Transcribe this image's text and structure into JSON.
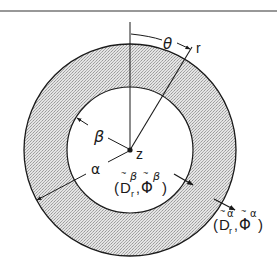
{
  "diagram": {
    "type": "annular cross-section (concentric cylinders) with polar coordinates",
    "colors": {
      "line": "#1a1a1a",
      "shell_fill": "#cfcfcf",
      "inner_fill": "#ffffff",
      "background": "#ffffff"
    },
    "geometry": {
      "center": [
        130,
        150
      ],
      "outer_radius": 106,
      "inner_radius": 63,
      "top_rule_y": 11
    },
    "labels": {
      "theta": "θ",
      "r": "r",
      "z": "z",
      "beta": "β",
      "alpha": "α",
      "inner_pair_open": "(",
      "inner_D": "D",
      "inner_D_sub": "r",
      "inner_D_sup": "β",
      "inner_comma": ",",
      "inner_Phi": "Φ",
      "inner_Phi_sup": "β",
      "inner_pair_close": ")",
      "outer_pair_open": "(",
      "outer_D": "D",
      "outer_D_sub": "r",
      "outer_D_sup": "α",
      "outer_comma": ",",
      "outer_Phi": "Φ",
      "outer_Phi_sup": "α",
      "outer_pair_close": ")",
      "tilde": "~"
    }
  }
}
